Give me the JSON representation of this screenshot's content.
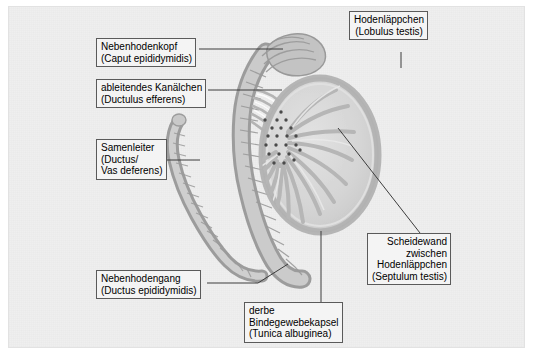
{
  "figure": {
    "language": "de",
    "background_color": "#efefef",
    "page_color": "#ffffff",
    "label_box_fill": "#f4f4f4",
    "label_box_border": "#5a5a5a",
    "leader_line_color": "#3c3c3c",
    "tissue_light": "#d8d8d8",
    "tissue_mid": "#bdbdbd",
    "tissue_dark": "#9a9a9a",
    "rete_dot_color": "#4a4a4a"
  },
  "labels": [
    {
      "id": "lobulus-testis",
      "name": "hodenlaeppchen",
      "line1": "Hodenläppchen",
      "line2": "(Lobulus testis)",
      "align": "center",
      "leader_from": [
        401,
        52
      ],
      "leader_to": [
        401,
        66
      ]
    },
    {
      "id": "caput-epididymidis",
      "name": "nebenhodenkopf",
      "line1": "Nebenhodenkopf",
      "line2": "(Caput epididymidis)",
      "align": "left",
      "leader_from": [
        199,
        49
      ],
      "leader_to": [
        283,
        49
      ]
    },
    {
      "id": "ductulus-efferens",
      "name": "ableitendes-kanaelchen",
      "line1": "ableitendes Kanälchen",
      "line2": "(Ductulus efferens)",
      "align": "left",
      "leader_from": [
        208,
        90
      ],
      "leader_to": [
        280,
        90
      ]
    },
    {
      "id": "ductus-deferens",
      "name": "samenleiter",
      "line1": "Samenleiter",
      "line2": "(Ductus/",
      "line3": "Vas deferens)",
      "align": "left",
      "leader_from": [
        167,
        160
      ],
      "leader_to": [
        200,
        160
      ]
    },
    {
      "id": "ductus-epididymidis",
      "name": "nebenhodengang",
      "line1": "Nebenhodengang",
      "line2": "(Ductus epididymidis)",
      "align": "left",
      "leader_from": [
        207,
        283
      ],
      "leader_to": [
        258,
        283
      ]
    },
    {
      "id": "tunica-albuginea",
      "name": "derbe-bindegewebekapsel",
      "line1": "derbe",
      "line2": "Bindegewebekapsel",
      "line3": "(Tunica albuginea)",
      "align": "left",
      "leader_from": [
        321,
        231
      ],
      "leader_to": [
        321,
        302
      ]
    },
    {
      "id": "septulum-testis",
      "name": "scheidewand-zwischen-hodenlaeppchen",
      "line1": "Scheidewand",
      "line2": "zwischen",
      "line3": "Hodenläppchen",
      "line4": "(Septulum testis)",
      "align": "right",
      "leader_from": [
        338,
        128
      ],
      "leader_to": [
        420,
        233
      ]
    }
  ],
  "anatomy": {
    "testis": {
      "name": "testis-cross-section",
      "center": [
        320,
        155
      ],
      "rx": 58,
      "ry": 77,
      "capsule_label": "Tunica albuginea",
      "septa_count": 14,
      "rete_dots": 22
    },
    "epididymis": {
      "name": "epididymis",
      "head_label": "Caput epididymidis",
      "body_label": "Corpus",
      "tail_label": "Cauda"
    },
    "vas_deferens": {
      "name": "vas-deferens-duct",
      "label": "Ductus deferens"
    }
  }
}
